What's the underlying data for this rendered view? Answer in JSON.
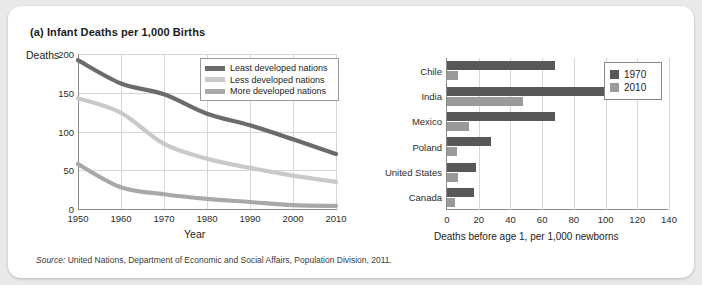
{
  "figure": {
    "panel_a_title": "(a) Infant Deaths per 1,000 Births",
    "panel_b_title": "(b) Infant Mortality Rates: 1970 and 2010",
    "source_label": "Source:",
    "source_text": " United Nations, Department of Economic and Social Affairs, Population Division, 2011."
  },
  "colors": {
    "least_developed": "#6b6b6b",
    "less_developed": "#c9c9c9",
    "more_developed": "#a8a8a8",
    "bar_1970": "#585858",
    "bar_2010": "#9a9a9a",
    "gridline": "#d6d6d6",
    "axis": "#8a8a8a",
    "card_background": "#ffffff",
    "page_background": "#e9e9e9"
  },
  "chart_data": [
    {
      "id": "panel-a",
      "type": "line",
      "title": "(a) Infant Deaths per 1,000 Births",
      "xlabel": "Year",
      "ylabel": "Deaths",
      "x": [
        1950,
        1960,
        1970,
        1980,
        1990,
        2000,
        2010
      ],
      "xticks": [
        "1950",
        "1960",
        "1970",
        "1980",
        "1990",
        "2000",
        "2010"
      ],
      "yticks": [
        "0",
        "50",
        "100",
        "150",
        "200"
      ],
      "xlim": [
        1950,
        2010
      ],
      "ylim": [
        0,
        200
      ],
      "grid": true,
      "legend_position": "upper-right",
      "series": [
        {
          "name": "Least developed nations",
          "color": "#6b6b6b",
          "values": [
            192,
            162,
            148,
            123,
            108,
            90,
            71
          ]
        },
        {
          "name": "Less developed nations",
          "color": "#c9c9c9",
          "values": [
            143,
            124,
            84,
            65,
            53,
            43,
            35
          ]
        },
        {
          "name": "More developed nations",
          "color": "#a8a8a8",
          "values": [
            58,
            28,
            19,
            13,
            9,
            5,
            4
          ]
        }
      ]
    },
    {
      "id": "panel-b",
      "type": "bar",
      "orientation": "horizontal",
      "title": "(b) Infant Mortality Rates: 1970 and 2010",
      "xlabel": "Deaths  before age 1, per 1,000 newborns",
      "ylabel": "",
      "categories": [
        "Chile",
        "India",
        "Mexico",
        "Poland",
        "United States",
        "Canada"
      ],
      "xticks": [
        "0",
        "20",
        "40",
        "60",
        "80",
        "100",
        "120",
        "140"
      ],
      "xlim": [
        0,
        140
      ],
      "grid": true,
      "legend_position": "right",
      "series": [
        {
          "name": "1970",
          "color": "#585858",
          "values": [
            68,
            118,
            68,
            28,
            18,
            17
          ]
        },
        {
          "name": "2010",
          "color": "#9a9a9a",
          "values": [
            7,
            48,
            14,
            6,
            7,
            5
          ]
        }
      ]
    }
  ]
}
